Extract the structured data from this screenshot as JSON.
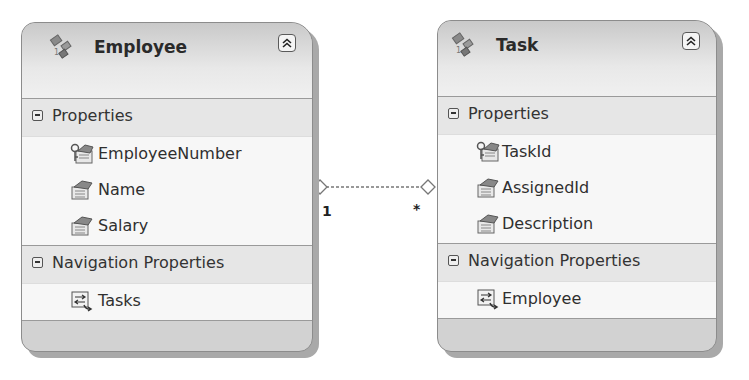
{
  "diagram": {
    "entities": [
      {
        "name": "Employee",
        "icon": "entity-icon",
        "collapse_icon": "double-chevron-up-icon",
        "sections": [
          {
            "label": "Properties",
            "items": [
              {
                "label": "EmployeeNumber",
                "icon": "key-property-icon"
              },
              {
                "label": "Name",
                "icon": "property-icon"
              },
              {
                "label": "Salary",
                "icon": "property-icon"
              }
            ]
          },
          {
            "label": "Navigation Properties",
            "items": [
              {
                "label": "Tasks",
                "icon": "navigation-property-icon"
              }
            ]
          }
        ]
      },
      {
        "name": "Task",
        "icon": "entity-icon",
        "collapse_icon": "double-chevron-up-icon",
        "sections": [
          {
            "label": "Properties",
            "items": [
              {
                "label": "TaskId",
                "icon": "key-property-icon"
              },
              {
                "label": "AssignedId",
                "icon": "property-icon"
              },
              {
                "label": "Description",
                "icon": "property-icon"
              }
            ]
          },
          {
            "label": "Navigation Properties",
            "items": [
              {
                "label": "Employee",
                "icon": "navigation-property-icon"
              }
            ]
          }
        ]
      }
    ],
    "association": {
      "from": "Employee",
      "to": "Task",
      "from_multiplicity": "1",
      "to_multiplicity": "*",
      "line_style": "dashed"
    }
  }
}
